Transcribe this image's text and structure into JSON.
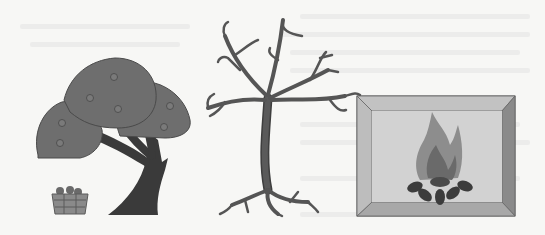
{
  "scene": {
    "description": "Three grayscale illustrations side by side",
    "panels": [
      {
        "id": "fruit-tree",
        "label": "fruit tree with basket",
        "fruit_count": 7
      },
      {
        "id": "bare-tree",
        "label": "bare tree without leaves"
      },
      {
        "id": "fireplace",
        "label": "fire burning logs in a framed box"
      }
    ]
  },
  "colors": {
    "background": "#f7f7f5",
    "canopy": "#6e6e6e",
    "trunk": "#3a3a3a",
    "bare_tree": "#5a5a5a",
    "frame_inner": "#cfcfcf",
    "frame_top": "#c2c2c2",
    "frame_right": "#8a8a8a",
    "frame_bottom": "#a8a8a8",
    "frame_left": "#bdbdbd",
    "flame": "#7a7a7a",
    "logs": "#3c3c3c"
  }
}
